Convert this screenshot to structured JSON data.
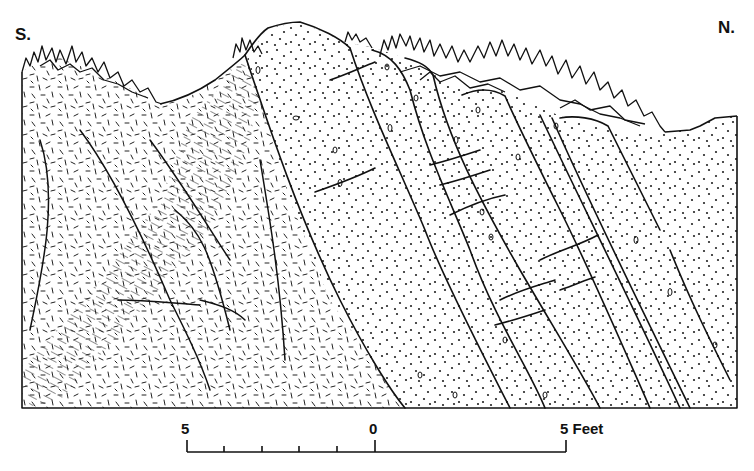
{
  "figure": {
    "type": "geologic cross-section sketch",
    "orientation": {
      "left_label": "S.",
      "right_label": "N."
    },
    "scale_bar": {
      "labels": [
        "5",
        "0",
        "5 Feet"
      ],
      "unit": "Feet",
      "left_value": 5,
      "center_value": 0,
      "right_value": 5,
      "minor_ticks_left_of_zero": 4
    },
    "units": [
      {
        "name": "fine-dash-textured-rock",
        "pattern": "short random dashes",
        "position": "left (south)"
      },
      {
        "name": "laminated-band",
        "pattern": "parallel streaks",
        "position": "left-center"
      },
      {
        "name": "dotted-sandstone-beds",
        "pattern": "dots with small pebbles",
        "position": "center to right (north)"
      },
      {
        "name": "thin-laminated-band",
        "pattern": "parallel lines",
        "position": "right-center"
      }
    ],
    "vegetation": "grass/brush tufts along top surface",
    "colors": {
      "ink": "#111111",
      "paper": "#ffffff"
    }
  }
}
